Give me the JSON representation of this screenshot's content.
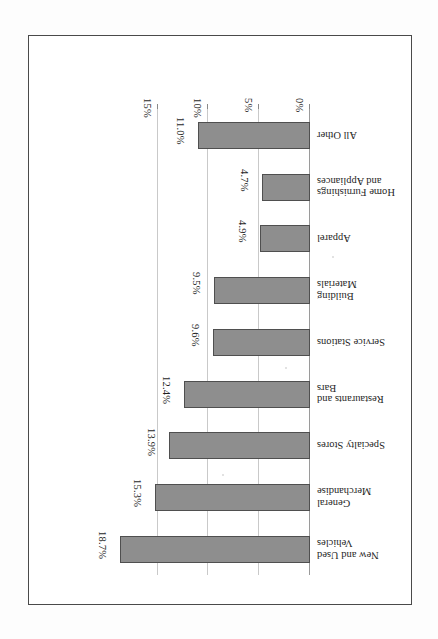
{
  "document": {
    "kind": "scanned-figure",
    "orientation": "rotated-180",
    "frame_border_color": "#4a4a4a",
    "background_color": "#ffffff"
  },
  "chart_data": {
    "type": "bar",
    "orientation": "horizontal",
    "title": "",
    "subtitle": "",
    "xlabel": "",
    "ylabel": "",
    "categories": [
      "New and Used Vehicles",
      "General Merchandise",
      "Specialty Stores",
      "Restaurants and Bars",
      "Service Stations",
      "Building Materials",
      "Apparel",
      "Home Furnishings and Appliances",
      "All Other"
    ],
    "values": [
      18.7,
      15.3,
      13.9,
      12.4,
      9.6,
      9.5,
      4.9,
      4.7,
      11.0
    ],
    "value_labels": [
      "18.7%",
      "15.3%",
      "13.9%",
      "12.4%",
      "9.6%",
      "9.5%",
      "4.9%",
      "4.7%",
      "11.0%"
    ],
    "axis_ticks": [
      "0%",
      "5%",
      "10%",
      "15%"
    ],
    "axis_tick_values": [
      0,
      5,
      10,
      15
    ],
    "xlim": [
      0,
      20
    ],
    "grid": true,
    "legend": false,
    "bar_fill_color": "#8e8e8e",
    "bar_border_color": "#4f4f4f",
    "gridline_color": "#c9c9c9"
  },
  "categories_detail": [
    {
      "label": "New and Used Vehicles",
      "lines": [
        "New and Used",
        "Vehicles"
      ],
      "value": 18.7,
      "value_label": "18.7%"
    },
    {
      "label": "General Merchandise",
      "lines": [
        "General",
        "Merchandise"
      ],
      "value": 15.3,
      "value_label": "15.3%"
    },
    {
      "label": "Specialty Stores",
      "lines": [
        "Specialty Stores"
      ],
      "value": 13.9,
      "value_label": "13.9%"
    },
    {
      "label": "Restaurants and Bars",
      "lines": [
        "Restaurants and",
        "Bars"
      ],
      "value": 12.4,
      "value_label": "12.4%"
    },
    {
      "label": "Service Stations",
      "lines": [
        "Service Stations"
      ],
      "value": 9.6,
      "value_label": "9.6%"
    },
    {
      "label": "Building Materials",
      "lines": [
        "Building",
        "Materials"
      ],
      "value": 9.5,
      "value_label": "9.5%"
    },
    {
      "label": "Apparel",
      "lines": [
        "Apparel"
      ],
      "value": 4.9,
      "value_label": "4.9%"
    },
    {
      "label": "Home Furnishings and Appliances",
      "lines": [
        "Home Furnishings",
        "and Appliances"
      ],
      "value": 4.7,
      "value_label": "4.7%"
    },
    {
      "label": "All Other",
      "lines": [
        "All Other"
      ],
      "value": 11.0,
      "value_label": "11.0%"
    }
  ]
}
